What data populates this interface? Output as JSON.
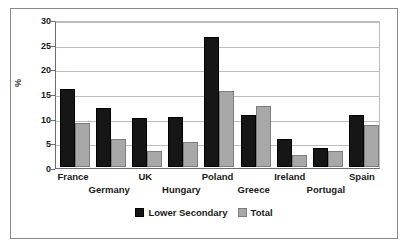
{
  "chart_data": {
    "type": "bar",
    "title": "",
    "xlabel": "",
    "ylabel": "%",
    "ylim": [
      0,
      30
    ],
    "yticks": [
      0,
      5,
      10,
      15,
      20,
      25,
      30
    ],
    "ytick_labels": [
      "0",
      "5",
      "10",
      "15",
      "20",
      "25",
      "30"
    ],
    "grid": true,
    "legend_position": "bottom",
    "categories": [
      "France",
      "Germany",
      "UK",
      "Hungary",
      "Poland",
      "Greece",
      "Ireland",
      "Portugal",
      "Spain"
    ],
    "series": [
      {
        "name": "Lower Secondary",
        "color": "#161616",
        "values": [
          15.8,
          11.9,
          9.9,
          10.1,
          26.3,
          10.5,
          5.7,
          3.8,
          10.6
        ]
      },
      {
        "name": "Total",
        "color": "#a8a8a8",
        "values": [
          9.0,
          5.6,
          3.3,
          5.1,
          15.4,
          12.4,
          2.5,
          3.3,
          8.5
        ]
      }
    ]
  },
  "legend": {
    "entries": [
      {
        "label": "Lower Secondary"
      },
      {
        "label": "Total"
      }
    ]
  },
  "colors": {
    "series_lower_secondary": "#161616",
    "series_total": "#a8a8a8",
    "gridline": "#bdbdbd",
    "axis": "#6d6d6d",
    "frame_border": "#8a8a8a",
    "background": "#ffffff",
    "text": "#1a1a1a"
  }
}
